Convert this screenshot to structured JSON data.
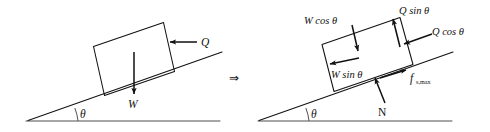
{
  "figure": {
    "width": 490,
    "height": 132,
    "background_color": "#ffffff",
    "line_color": "#111111",
    "implies_symbol": "⇒"
  },
  "left_diagram": {
    "name": "block-on-incline-applied-forces",
    "angle_label": "θ",
    "forces": [
      {
        "id": "Q",
        "label": "Q",
        "direction": "horizontal-left",
        "description": "Applied horizontal push on block"
      },
      {
        "id": "W",
        "label": "W",
        "direction": "vertical-down",
        "description": "Weight of block acting downward"
      }
    ]
  },
  "right_diagram": {
    "name": "block-on-incline-resolved-components",
    "angle_label": "θ",
    "forces": [
      {
        "id": "Wcos",
        "label": "W cos θ",
        "direction": "perpendicular-into-incline",
        "description": "Weight component normal to incline"
      },
      {
        "id": "Wsin",
        "label": "W sin θ",
        "direction": "down-the-incline",
        "description": "Weight component along incline"
      },
      {
        "id": "Qsin",
        "label": "Q sin θ",
        "direction": "perpendicular-away-from-incline",
        "description": "Applied force component normal to incline"
      },
      {
        "id": "Qcos",
        "label": "Q cos θ",
        "direction": "horizontal-left-into-incline",
        "description": "Applied force component along incline"
      },
      {
        "id": "N",
        "label": "N",
        "direction": "perpendicular-away-from-incline",
        "description": "Normal reaction force"
      },
      {
        "id": "fsmax",
        "label": "f",
        "subscript": "s,max",
        "direction": "up-the-incline",
        "description": "Maximum static friction force"
      }
    ]
  }
}
